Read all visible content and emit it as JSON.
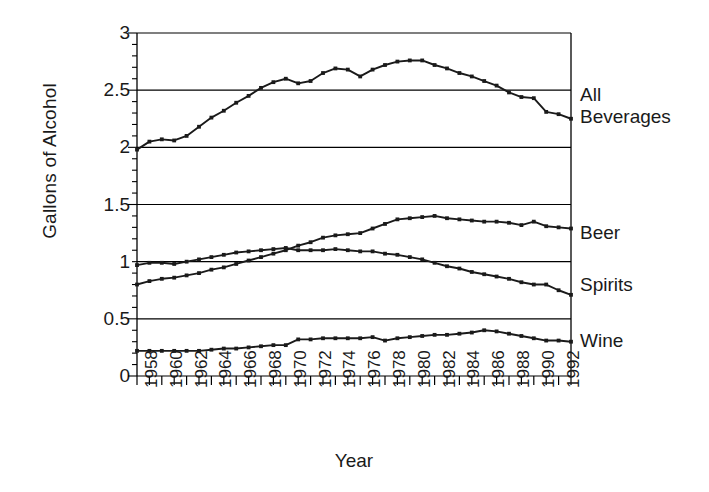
{
  "chart_data": {
    "type": "line",
    "title": "",
    "xlabel": "Year",
    "ylabel": "Gallons of Alcohol",
    "ylim": [
      0,
      3
    ],
    "yticks": [
      "0",
      "0.5",
      "1",
      "1.5",
      "2",
      "2.5",
      "3"
    ],
    "ytick_values": [
      0,
      0.5,
      1,
      1.5,
      2,
      2.5,
      3
    ],
    "xlim": [
      1958,
      1993
    ],
    "xticks": [
      "1958",
      "1960",
      "1962",
      "1964",
      "1966",
      "1968",
      "1970",
      "1972",
      "1974",
      "1976",
      "1978",
      "1980",
      "1982",
      "1984",
      "1986",
      "1988",
      "1990",
      "1992"
    ],
    "xtick_values": [
      1958,
      1960,
      1962,
      1964,
      1966,
      1968,
      1970,
      1972,
      1974,
      1976,
      1978,
      1980,
      1982,
      1984,
      1986,
      1988,
      1990,
      1992
    ],
    "minor_xticks_every": 1,
    "grid": "horizontal",
    "grid_color": "#000000",
    "line_color": "#1a1a1a",
    "marker": "square",
    "legend_position": "right-inline-labels",
    "x": [
      1958,
      1959,
      1960,
      1961,
      1962,
      1963,
      1964,
      1965,
      1966,
      1967,
      1968,
      1969,
      1970,
      1971,
      1972,
      1973,
      1974,
      1975,
      1976,
      1977,
      1978,
      1979,
      1980,
      1981,
      1982,
      1983,
      1984,
      1985,
      1986,
      1987,
      1988,
      1989,
      1990,
      1991,
      1992,
      1993
    ],
    "series": [
      {
        "name": "All Beverages",
        "label": "All\nBeverages",
        "values": [
          1.98,
          2.05,
          2.07,
          2.06,
          2.1,
          2.18,
          2.26,
          2.32,
          2.39,
          2.45,
          2.52,
          2.57,
          2.6,
          2.56,
          2.58,
          2.65,
          2.69,
          2.68,
          2.62,
          2.68,
          2.72,
          2.75,
          2.76,
          2.76,
          2.72,
          2.69,
          2.65,
          2.62,
          2.58,
          2.54,
          2.48,
          2.44,
          2.43,
          2.31,
          2.29,
          2.25
        ]
      },
      {
        "name": "Beer",
        "label": "Beer",
        "values": [
          0.8,
          0.83,
          0.85,
          0.86,
          0.88,
          0.9,
          0.93,
          0.95,
          0.98,
          1.01,
          1.04,
          1.07,
          1.1,
          1.14,
          1.17,
          1.21,
          1.23,
          1.24,
          1.25,
          1.29,
          1.33,
          1.37,
          1.38,
          1.39,
          1.4,
          1.38,
          1.37,
          1.36,
          1.35,
          1.35,
          1.34,
          1.32,
          1.35,
          1.31,
          1.3,
          1.29
        ]
      },
      {
        "name": "Spirits",
        "label": "Spirits",
        "values": [
          0.97,
          0.99,
          0.99,
          0.98,
          1.0,
          1.02,
          1.04,
          1.06,
          1.08,
          1.09,
          1.1,
          1.11,
          1.12,
          1.1,
          1.1,
          1.1,
          1.11,
          1.1,
          1.09,
          1.09,
          1.07,
          1.06,
          1.04,
          1.02,
          0.99,
          0.96,
          0.94,
          0.91,
          0.89,
          0.87,
          0.85,
          0.82,
          0.8,
          0.8,
          0.75,
          0.71
        ]
      },
      {
        "name": "Wine",
        "label": "Wine",
        "values": [
          0.22,
          0.22,
          0.22,
          0.22,
          0.22,
          0.22,
          0.23,
          0.24,
          0.24,
          0.25,
          0.26,
          0.27,
          0.27,
          0.32,
          0.32,
          0.33,
          0.33,
          0.33,
          0.33,
          0.34,
          0.31,
          0.33,
          0.34,
          0.35,
          0.36,
          0.36,
          0.37,
          0.38,
          0.4,
          0.39,
          0.37,
          0.35,
          0.33,
          0.31,
          0.31,
          0.3
        ]
      }
    ]
  },
  "axis": {
    "y_title": "Gallons of Alcohol",
    "x_title": "Year"
  },
  "series_labels": {
    "all_beverages_line1": "All",
    "all_beverages_line2": "Beverages",
    "beer": "Beer",
    "spirits": "Spirits",
    "wine": "Wine"
  }
}
